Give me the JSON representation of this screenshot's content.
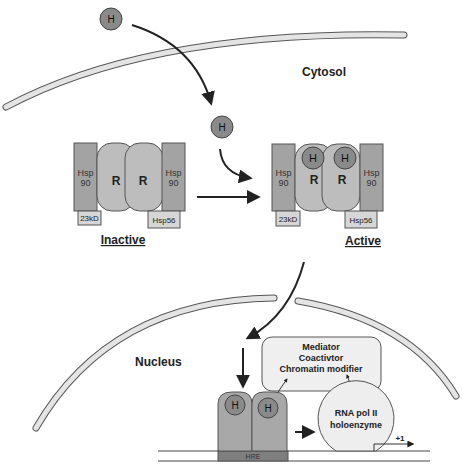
{
  "compartments": {
    "cytosol": "Cytosol",
    "nucleus": "Nucleus"
  },
  "hormone": {
    "label": "H",
    "color": "#8a8a8a"
  },
  "inactive_complex": {
    "state_label": "Inactive",
    "hsp90_left": [
      "Hsp",
      "90"
    ],
    "hsp90_right": [
      "Hsp",
      "90"
    ],
    "receptor_left": "R",
    "receptor_right": "R",
    "cochaperone_left": "23kD",
    "cochaperone_right": "Hsp56"
  },
  "active_complex": {
    "state_label": "Active",
    "hsp90_left": [
      "Hsp",
      "90"
    ],
    "hsp90_right": [
      "Hsp",
      "90"
    ],
    "receptor_left": "R",
    "receptor_right": "R",
    "hormone_left": "H",
    "hormone_right": "H",
    "cochaperone_left": "23kD",
    "cochaperone_right": "Hsp56"
  },
  "nuclear_events": {
    "coregulator_box": [
      "Mediator",
      "Coactivtor",
      "Chromatin modifier"
    ],
    "dimer_hormone_left": "H",
    "dimer_hormone_right": "H",
    "response_element": "HRE",
    "polymerase": [
      "RNA pol II",
      "holoenzyme"
    ],
    "tss_label": "+1"
  },
  "colors": {
    "hsp90": "#a3a3a3",
    "receptor": "#bdbdbd",
    "tag": "#d6d6d6",
    "membrane": "#e4e4e4",
    "hre": "#7f7f7f",
    "box": "#efefef"
  }
}
